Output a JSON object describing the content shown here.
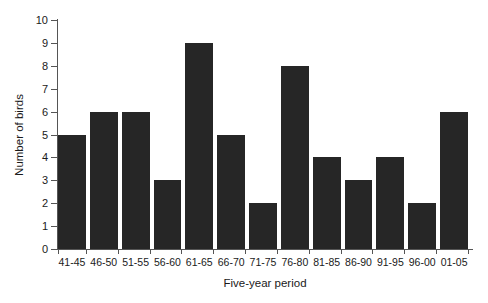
{
  "chart_data": {
    "type": "bar",
    "title": "",
    "xlabel": "Five-year period",
    "ylabel": "Number of birds",
    "categories": [
      "41-45",
      "46-50",
      "51-55",
      "56-60",
      "61-65",
      "66-70",
      "71-75",
      "76-80",
      "81-85",
      "86-90",
      "91-95",
      "96-00",
      "01-05"
    ],
    "values": [
      5,
      6,
      6,
      3,
      9,
      5,
      2,
      8,
      4,
      3,
      4,
      2,
      6
    ],
    "series": [
      {
        "name": "Number of birds",
        "values": [
          5,
          6,
          6,
          3,
          9,
          5,
          2,
          8,
          4,
          3,
          4,
          2,
          6
        ]
      }
    ],
    "ylim": [
      0,
      10
    ],
    "yticks": [
      0,
      1,
      2,
      3,
      4,
      5,
      6,
      7,
      8,
      9,
      10
    ],
    "ytick_labels": [
      "0",
      "1",
      "2",
      "3",
      "4",
      "5",
      "6",
      "7",
      "8",
      "9",
      "10"
    ],
    "grid": false,
    "legend": false,
    "legend_position": "none",
    "bar_color": "#262626",
    "axis_color": "#555555",
    "background_color": "#ffffff"
  }
}
